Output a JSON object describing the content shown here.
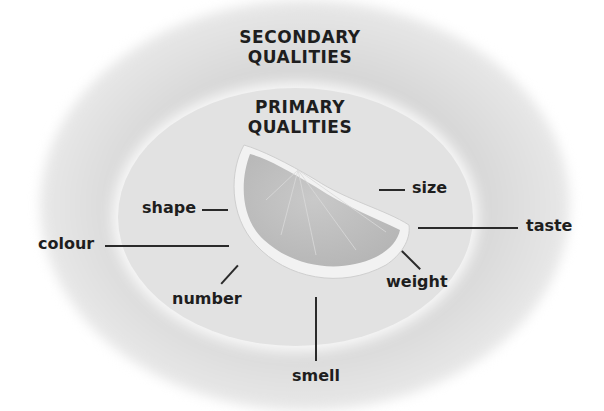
{
  "headings": {
    "secondary": "SECONDARY QUALITIES",
    "secondary_line1": "SECONDARY",
    "secondary_line2": "QUALITIES",
    "primary_line1": "PRIMARY",
    "primary_line2": "QUALITIES"
  },
  "labels": {
    "shape": "shape",
    "colour": "colour",
    "number": "number",
    "size": "size",
    "taste": "taste",
    "weight": "weight",
    "smell": "smell"
  },
  "image": {
    "subject": "orange-slice",
    "description": "Grayscale orange/lemon wedge"
  },
  "colors": {
    "text": "#1e1e1e",
    "inner_ellipse": "#e2e2e2",
    "outer_glow": "#cfcfcf",
    "background": "#ffffff"
  }
}
